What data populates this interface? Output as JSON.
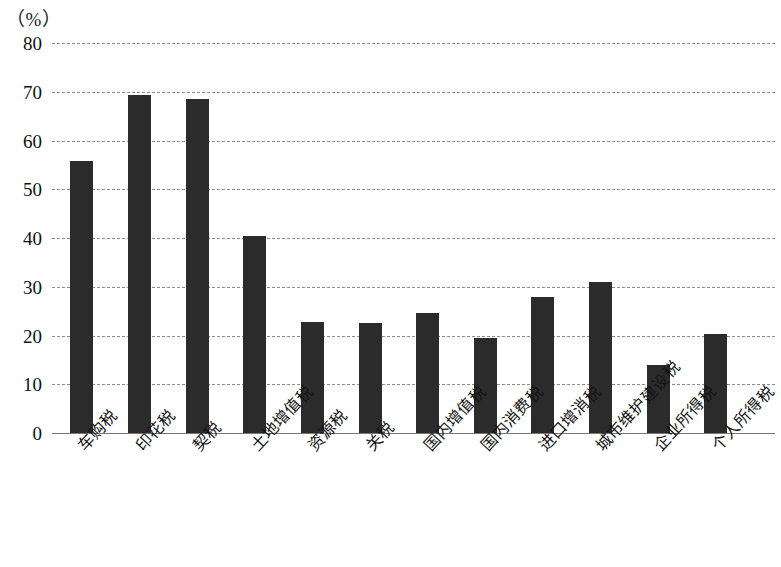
{
  "chart_data": {
    "type": "bar",
    "title": "",
    "subtitle": "",
    "unit_label": "（%）",
    "xlabel": "",
    "ylabel": "",
    "ylim": [
      0,
      80
    ],
    "ytick_step": 10,
    "yticks": [
      80,
      70,
      60,
      50,
      40,
      30,
      20,
      10,
      0
    ],
    "grid": true,
    "gridline_style": "dashed",
    "legend": null,
    "legend_position": "none",
    "bar_color": "#2b2b2b",
    "categories": [
      "车购税",
      "印花税",
      "契税",
      "土地增值税",
      "资源税",
      "关税",
      "国内增值税",
      "国内消费税",
      "进口增消税",
      "城市维护建设税",
      "企业所得税",
      "个人所得税"
    ],
    "values": [
      55.8,
      69.3,
      68.5,
      40.5,
      22.7,
      22.6,
      24.7,
      19.5,
      27.8,
      31.0,
      14.0,
      20.3
    ],
    "annotations": []
  }
}
